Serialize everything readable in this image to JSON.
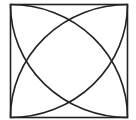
{
  "diagram": {
    "square": {
      "x": 10.5,
      "y": 4.5,
      "width": 117,
      "height": 113
    },
    "stroke_color": "#222222",
    "stroke_width": 1.6,
    "background": "#ffffff",
    "arcs": [
      {
        "center": "top-left",
        "from": "top-right",
        "to": "bottom-left"
      },
      {
        "center": "top-right",
        "from": "top-left",
        "to": "bottom-right"
      },
      {
        "center": "bottom-left",
        "from": "top-left",
        "to": "bottom-right"
      },
      {
        "center": "bottom-right",
        "from": "top-right",
        "to": "bottom-left"
      }
    ]
  }
}
